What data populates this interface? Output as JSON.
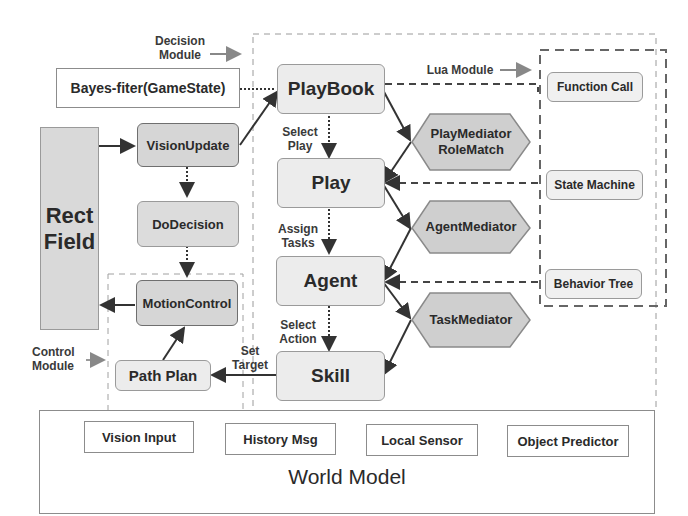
{
  "labels": {
    "decision_module": [
      "Decision",
      "Module"
    ],
    "lua_module": "Lua Module",
    "control_module": [
      "Control",
      "Module"
    ],
    "select_play": [
      "Select",
      "Play"
    ],
    "assign_tasks": [
      "Assign",
      "Tasks"
    ],
    "select_action": [
      "Select",
      "Action"
    ],
    "set_target": [
      "Set",
      "Target"
    ]
  },
  "nodes": {
    "rect_field": [
      "Rect",
      "Field"
    ],
    "bayes_filter": "Bayes-fiter(GameState)",
    "vision_update": "VisionUpdate",
    "do_decision": "DoDecision",
    "motion_control": "MotionControl",
    "path_plan": "Path Plan",
    "playbook": "PlayBook",
    "play": "Play",
    "agent": "Agent",
    "skill": "Skill",
    "play_mediator": [
      "PlayMediator",
      "RoleMatch"
    ],
    "agent_mediator": "AgentMediator",
    "task_mediator": "TaskMediator",
    "function_call": "Function Call",
    "state_machine": "State Machine",
    "behavior_tree": "Behavior Tree"
  },
  "world_model": {
    "title": "World Model",
    "items": [
      "Vision Input",
      "History Msg",
      "Local Sensor",
      "Object Predictor"
    ]
  },
  "colors": {
    "light_fill": "#ececec",
    "dark_fill": "#d6d6d6",
    "hex_fill": "#cfcfcf",
    "line": "#333333",
    "dash": "#555555"
  }
}
